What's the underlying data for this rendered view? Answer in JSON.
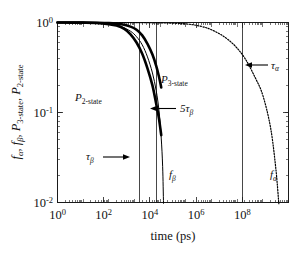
{
  "chart_data": {
    "type": "line",
    "title": "",
    "xlabel": "time (ps)",
    "ylabel": "f_alpha, f_beta, P_3-state, P_2-state",
    "xscale": "log",
    "yscale": "log",
    "xlim": [
      1,
      1000000000
    ],
    "ylim": [
      0.01,
      1
    ],
    "grid": false,
    "legend_position": "inline-labels",
    "x_tick_labels": [
      "10",
      "10",
      "10",
      "10",
      "10"
    ],
    "x_tick_exponents": [
      "0",
      "2",
      "4",
      "6",
      "8"
    ],
    "x_tick_values": [
      1,
      100,
      10000,
      1000000,
      100000000
    ],
    "y_tick_labels": [
      "10",
      "10",
      "10"
    ],
    "y_tick_exponents": [
      "0",
      "-1",
      "-2"
    ],
    "y_tick_values": [
      1,
      0.1,
      0.01
    ],
    "series": [
      {
        "name": "P_2-state",
        "style": "thick-solid",
        "x": [
          1,
          3.16,
          10,
          31.6,
          100,
          200,
          400,
          700,
          1200,
          2000,
          3200,
          5000,
          7000,
          9000,
          11000
        ],
        "y": [
          0.999,
          0.998,
          0.996,
          0.988,
          0.96,
          0.925,
          0.85,
          0.74,
          0.6,
          0.45,
          0.31,
          0.2,
          0.125,
          0.085,
          0.056
        ]
      },
      {
        "name": "P_3-state",
        "style": "thick-solid",
        "x": [
          1,
          3.16,
          10,
          31.6,
          100,
          316,
          700,
          1200,
          2000,
          3200,
          5000,
          7000,
          9000,
          11000
        ],
        "y": [
          0.9995,
          0.999,
          0.998,
          0.995,
          0.985,
          0.955,
          0.9,
          0.83,
          0.72,
          0.58,
          0.44,
          0.33,
          0.25,
          0.19
        ]
      },
      {
        "name": "f_beta",
        "style": "thin-solid",
        "x": [
          1,
          10,
          100,
          300,
          700,
          1200,
          2000,
          3200,
          5000,
          7000,
          9000,
          11000,
          12500,
          13500
        ],
        "y": [
          0.999,
          0.996,
          0.962,
          0.9,
          0.8,
          0.695,
          0.565,
          0.415,
          0.275,
          0.175,
          0.105,
          0.052,
          0.025,
          0.0098
        ]
      },
      {
        "name": "f_alpha",
        "style": "dotted",
        "x": [
          1,
          100,
          10000,
          100000,
          400000,
          1000000,
          3000000,
          8000000,
          20000000,
          50000000,
          100000000,
          200000000,
          320000000,
          420000000
        ],
        "y": [
          0.9995,
          0.999,
          0.99,
          0.965,
          0.905,
          0.83,
          0.7,
          0.555,
          0.4,
          0.245,
          0.155,
          0.068,
          0.024,
          0.0097
        ]
      }
    ],
    "vertical_markers": [
      {
        "name": "tau_beta",
        "x": 1500
      },
      {
        "name": "five_tau_beta",
        "x": 7500
      },
      {
        "name": "tau_alpha",
        "x": 16000000
      }
    ],
    "annotations": [
      {
        "name": "P_2-state",
        "base": "P",
        "sub": "2-state",
        "arrow": "none"
      },
      {
        "name": "P_3-state",
        "base": "P",
        "sub": "3-state",
        "arrow": "none"
      },
      {
        "name": "five-tau-beta",
        "base": "5τ",
        "sub": "β",
        "arrow": "left"
      },
      {
        "name": "tau-beta",
        "base": "τ",
        "sub": "β",
        "arrow": "right"
      },
      {
        "name": "tau-alpha",
        "base": "τ",
        "sub": "α",
        "arrow": "left"
      },
      {
        "name": "f-beta",
        "base": "f",
        "sub": "β",
        "arrow": "none"
      },
      {
        "name": "f-alpha",
        "base": "f",
        "sub": "α",
        "arrow": "none"
      }
    ]
  },
  "axes": {
    "x_label": "time (ps)",
    "y_label_parts": [
      "f",
      "α",
      ", ",
      "f",
      "β",
      ", ",
      "P",
      "3-state",
      ", ",
      "P",
      "2-state"
    ],
    "x_ticks": [
      {
        "mantissa": "10",
        "exponent": "0"
      },
      {
        "mantissa": "10",
        "exponent": "2"
      },
      {
        "mantissa": "10",
        "exponent": "4"
      },
      {
        "mantissa": "10",
        "exponent": "6"
      },
      {
        "mantissa": "10",
        "exponent": "8"
      }
    ],
    "y_ticks": [
      {
        "mantissa": "10",
        "exponent": "0"
      },
      {
        "mantissa": "10",
        "exponent": "-1"
      },
      {
        "mantissa": "10",
        "exponent": "-2"
      }
    ]
  },
  "labels": {
    "p2state_base": "P",
    "p2state_sub": "2-state",
    "p3state_base": "P",
    "p3state_sub": "3-state",
    "five_tau_beta_base": "5τ",
    "five_tau_beta_sub": "β",
    "tau_beta_base": "τ",
    "tau_beta_sub": "β",
    "tau_alpha_base": "τ",
    "tau_alpha_sub": "α",
    "f_beta_base": "f",
    "f_beta_sub": "β",
    "f_alpha_base": "f",
    "f_alpha_sub": "α"
  },
  "colors": {
    "ink": "#111111",
    "background": "#ffffff"
  }
}
